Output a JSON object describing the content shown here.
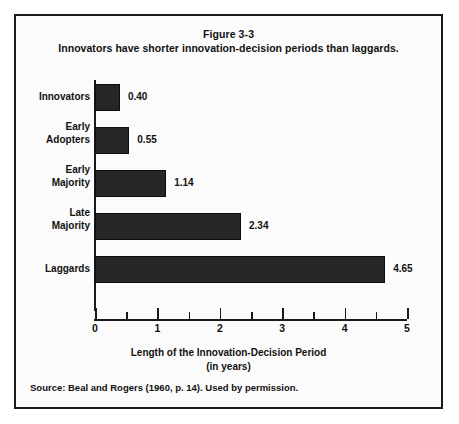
{
  "figure": {
    "title": "Figure 3-3",
    "subtitle": "Innovators have shorter innovation-decision periods than laggards.",
    "source": "Source: Beal and Rogers (1960, p. 14). Used by permission.",
    "border_color": "#1a1a1a",
    "background_color": "#fbfbfb"
  },
  "axis": {
    "x_title_line1": "Length of the Innovation-Decision Period",
    "x_title_line2": "(in years)",
    "x_ticks": [
      "0",
      "1",
      "2",
      "3",
      "4",
      "5"
    ],
    "x_min": 0,
    "x_max": 5,
    "x_minor_step": 0.5
  },
  "bars": [
    {
      "label_line1": "Innovators",
      "label_line2": "",
      "value": "0.40",
      "num": 0.4
    },
    {
      "label_line1": "Early",
      "label_line2": "Adopters",
      "value": "0.55",
      "num": 0.55
    },
    {
      "label_line1": "Early",
      "label_line2": "Majority",
      "value": "1.14",
      "num": 1.14
    },
    {
      "label_line1": "Late",
      "label_line2": "Majority",
      "value": "2.34",
      "num": 2.34
    },
    {
      "label_line1": "Laggards",
      "label_line2": "",
      "value": "4.65",
      "num": 4.65
    }
  ],
  "chart_data": {
    "type": "bar",
    "orientation": "horizontal",
    "title": "Figure 3-3",
    "subtitle": "Innovators have shorter innovation-decision periods than laggards.",
    "categories": [
      "Innovators",
      "Early Adopters",
      "Early Majority",
      "Late Majority",
      "Laggards"
    ],
    "values": [
      0.4,
      0.55,
      1.14,
      2.34,
      4.65
    ],
    "data_labels": [
      "0.40",
      "0.55",
      "1.14",
      "2.34",
      "4.65"
    ],
    "xlabel": "Length of the Innovation-Decision Period (in years)",
    "ylabel": "",
    "xlim": [
      0,
      5
    ],
    "x_tick_labels": [
      "0",
      "1",
      "2",
      "3",
      "4",
      "5"
    ],
    "x_minor_tick_step": 0.5,
    "grid": false,
    "legend": false,
    "bar_color": "#262626",
    "source": "Source: Beal and Rogers (1960, p. 14). Used by permission."
  }
}
